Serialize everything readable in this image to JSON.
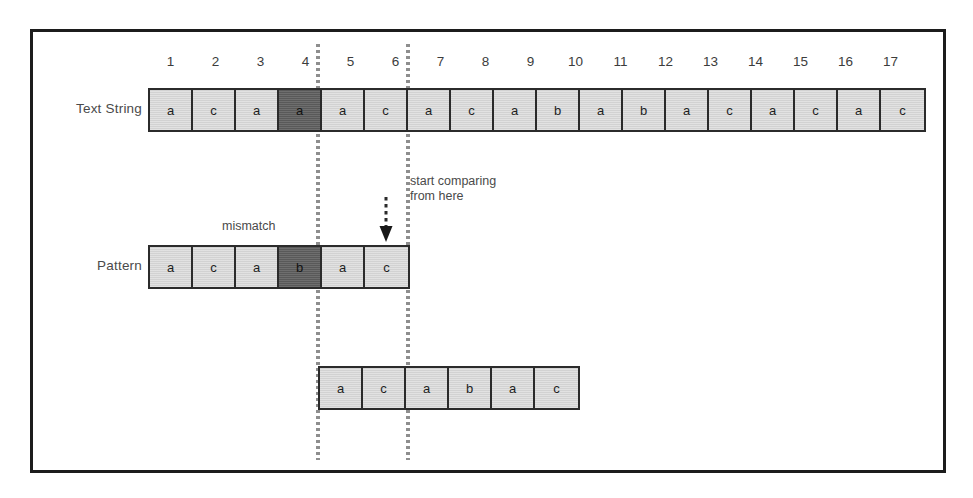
{
  "diagram": {
    "colors": {
      "cell_light": "#d2d2d2",
      "cell_dark": "#595959",
      "border": "#2b2b2b",
      "frame": "#1c1c1c",
      "guide_line": "#8e8e8e",
      "text": "#4a4a4a"
    }
  },
  "labels": {
    "text_string": "Text String",
    "pattern": "Pattern"
  },
  "index_ruler": {
    "numbers": [
      "1",
      "2",
      "3",
      "4",
      "5",
      "6",
      "7",
      "8",
      "9",
      "10",
      "11",
      "12",
      "13",
      "14",
      "15",
      "16",
      "17"
    ]
  },
  "text_string_row": {
    "cells": [
      {
        "char": "a",
        "highlight": false
      },
      {
        "char": "c",
        "highlight": false
      },
      {
        "char": "a",
        "highlight": false
      },
      {
        "char": "a",
        "highlight": true
      },
      {
        "char": "a",
        "highlight": false
      },
      {
        "char": "c",
        "highlight": false
      },
      {
        "char": "a",
        "highlight": false
      },
      {
        "char": "c",
        "highlight": false
      },
      {
        "char": "a",
        "highlight": false
      },
      {
        "char": "b",
        "highlight": false
      },
      {
        "char": "a",
        "highlight": false
      },
      {
        "char": "b",
        "highlight": false
      },
      {
        "char": "a",
        "highlight": false
      },
      {
        "char": "c",
        "highlight": false
      },
      {
        "char": "a",
        "highlight": false
      },
      {
        "char": "c",
        "highlight": false
      },
      {
        "char": "a",
        "highlight": false
      },
      {
        "char": "c",
        "highlight": false
      }
    ]
  },
  "pattern_row": {
    "cells": [
      {
        "char": "a",
        "highlight": false
      },
      {
        "char": "c",
        "highlight": false
      },
      {
        "char": "a",
        "highlight": false
      },
      {
        "char": "b",
        "highlight": true
      },
      {
        "char": "a",
        "highlight": false
      },
      {
        "char": "c",
        "highlight": false
      }
    ]
  },
  "shifted_pattern_row": {
    "cells": [
      {
        "char": "a",
        "highlight": false
      },
      {
        "char": "c",
        "highlight": false
      },
      {
        "char": "a",
        "highlight": false
      },
      {
        "char": "b",
        "highlight": false
      },
      {
        "char": "a",
        "highlight": false
      },
      {
        "char": "c",
        "highlight": false
      }
    ]
  },
  "annotations": {
    "mismatch": "mismatch",
    "start_comparing": "start comparing\nfrom here"
  },
  "icons": {
    "down_arrow": "down-arrow-icon"
  }
}
